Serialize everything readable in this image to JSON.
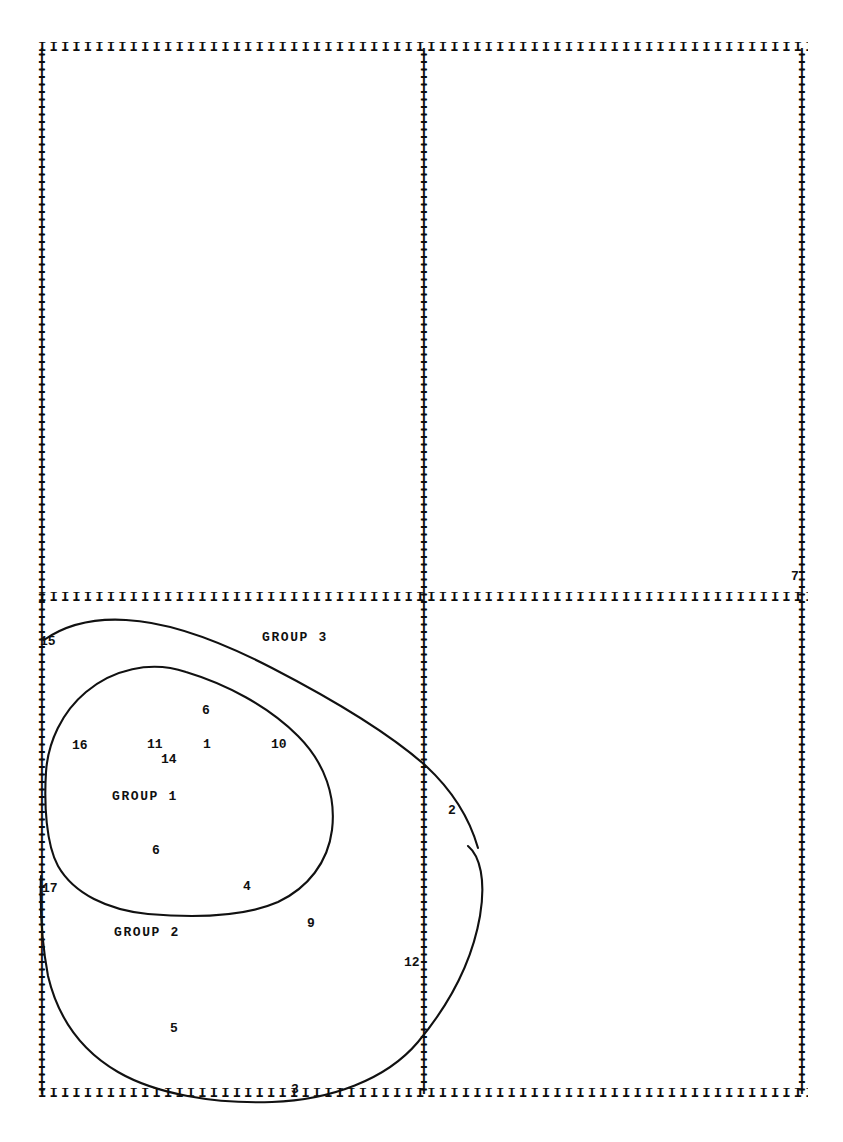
{
  "figure": {
    "top_remnant": ". ..",
    "background_color": "#ffffff",
    "ink_color": "#111111"
  },
  "axes": {
    "tick_char": "I",
    "top_ticks": "IIIIIIIIIIIIIIIIIIIIIIIIIIIIIIIIIIIIIIIIIIIIIIIIIIIIIIIIIIIIIIIIIIIIIIIIIIIIIIIIIIIIIIIIIIIIIIIIIIIIIIIIIIIIIIIIIIIIIIIIIII",
    "mid_ticks": "IIIIIIIIIIIIIIIIIIIIIIIIIIIIIIIIIIIIIIIIIIIIIIIIIIIIIIIIIIIIIIIIIIIIIIIIIIIIIIIIIIIIIIIIIIIIIIIIIIIIIIIIIIIIIIIIIIIIIIIIIII",
    "bottom_ticks": "IIIIIIIIIIIIIIIIIIIIIIIIIIIIIIIIIIIIIIIIIIIIIIIIIIIIIIIIIIIIIIIIIIIIIIIIIIIIIIIIIIIIIIIIIIIIIIIIIIIIIIIIIIIIIIIIIIIIIIIIIII",
    "vertical_tick_count": 140
  },
  "chart_data": {
    "type": "scatter",
    "title": "",
    "xlabel": "",
    "ylabel": "",
    "grid": false,
    "legend": "none",
    "xlim": [
      0,
      100
    ],
    "ylim": [
      0,
      100
    ],
    "groups": [
      {
        "name": "GROUP 1",
        "label_position": {
          "x": 112,
          "y": 789
        },
        "hull_path": "M 46,772 C 48,742 62,712 86,692 C 112,670 150,660 186,672 C 226,684 268,706 298,736 C 326,764 336,798 332,830 C 328,862 308,888 278,902 C 246,916 196,918 148,914 C 108,910 74,894 58,866 C 46,844 44,804 46,772 Z"
      },
      {
        "name": "GROUP 2",
        "label_position": {
          "x": 114,
          "y": 925
        },
        "hull_path": "M 41,876 C 40,906 42,944 48,976 C 58,1018 80,1050 118,1072 C 156,1094 214,1104 272,1102 C 330,1100 386,1080 418,1042 C 448,1006 472,962 480,916 C 486,880 480,856 468,846"
      },
      {
        "name": "GROUP 3",
        "label_position": {
          "x": 262,
          "y": 630
        },
        "hull_path": "M 44,640 C 64,626 92,618 126,620 C 168,622 218,640 272,668 C 330,698 390,734 426,766 C 454,792 470,820 478,848"
      }
    ],
    "points": [
      {
        "id": "15",
        "x": 44,
        "y": 643
      },
      {
        "id": "16",
        "x": 78,
        "y": 747
      },
      {
        "id": "11",
        "x": 150,
        "y": 745
      },
      {
        "id": "14",
        "x": 166,
        "y": 759
      },
      {
        "id": "1",
        "x": 207,
        "y": 746
      },
      {
        "id": "10",
        "x": 276,
        "y": 745
      },
      {
        "id": "6",
        "x": 206,
        "y": 711
      },
      {
        "id": "6b",
        "x": 156,
        "y": 851
      },
      {
        "id": "4",
        "x": 246,
        "y": 887
      },
      {
        "id": "17",
        "x": 46,
        "y": 890
      },
      {
        "id": "9",
        "x": 310,
        "y": 924
      },
      {
        "id": "2",
        "x": 452,
        "y": 812
      },
      {
        "id": "12",
        "x": 408,
        "y": 964
      },
      {
        "id": "5",
        "x": 173,
        "y": 1029
      },
      {
        "id": "3",
        "x": 294,
        "y": 1091
      },
      {
        "id": "7",
        "x": 795,
        "y": 578
      }
    ],
    "point_labels": [
      {
        "text": "15",
        "x": 40,
        "y": 634
      },
      {
        "text": "16",
        "x": 72,
        "y": 738
      },
      {
        "text": "11",
        "x": 147,
        "y": 737
      },
      {
        "text": "14",
        "x": 161,
        "y": 752
      },
      {
        "text": "1",
        "x": 203,
        "y": 737
      },
      {
        "text": "10",
        "x": 271,
        "y": 737
      },
      {
        "text": "6",
        "x": 202,
        "y": 703
      },
      {
        "text": "6",
        "x": 152,
        "y": 843
      },
      {
        "text": "4",
        "x": 243,
        "y": 879
      },
      {
        "text": "17",
        "x": 42,
        "y": 881
      },
      {
        "text": "9",
        "x": 307,
        "y": 916
      },
      {
        "text": "2",
        "x": 448,
        "y": 803
      },
      {
        "text": "12",
        "x": 404,
        "y": 955
      },
      {
        "text": "5",
        "x": 170,
        "y": 1021
      },
      {
        "text": "3",
        "x": 291,
        "y": 1082
      },
      {
        "text": "7",
        "x": 791,
        "y": 569
      }
    ]
  }
}
